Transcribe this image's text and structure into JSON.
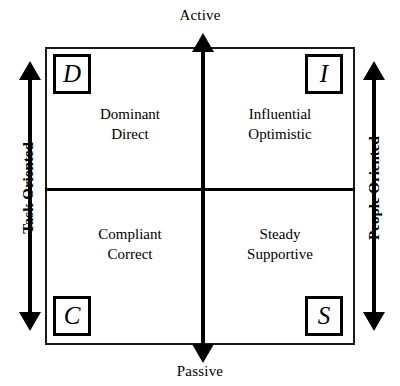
{
  "diagram": {
    "type": "quadrant",
    "axes": {
      "vertical": {
        "top_label": "Active",
        "bottom_label": "Passive",
        "arrow": "double-headed-vertical"
      },
      "left": {
        "label": "Task Oriented",
        "orientation": "rotated-bottom-to-top",
        "arrow": "double-headed-vertical"
      },
      "right": {
        "label": "People Oriented",
        "orientation": "rotated-bottom-to-top",
        "arrow": "double-headed-vertical"
      }
    },
    "quadrants": [
      {
        "position": "top-left",
        "letter": "D",
        "line1": "Dominant",
        "line2": "Direct"
      },
      {
        "position": "top-right",
        "letter": "I",
        "line1": "Influential",
        "line2": "Optimistic"
      },
      {
        "position": "bottom-left",
        "letter": "C",
        "line1": "Compliant",
        "line2": "Correct"
      },
      {
        "position": "bottom-right",
        "letter": "S",
        "line1": "Steady",
        "line2": "Supportive"
      }
    ],
    "colors": {
      "ink": "#000000",
      "background": "#ffffff",
      "frame": "#1a1a1a"
    }
  }
}
